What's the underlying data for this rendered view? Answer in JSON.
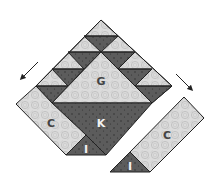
{
  "diagram": {
    "type": "quilt-block-assembly",
    "colors": {
      "light_fabric": "#d8d8d8",
      "light_swirl": "#bdbdbd",
      "dark_fabric": "#5a5a5a",
      "dark_dots": "#2e2e2e",
      "outline": "#222222",
      "label_light": "#444444",
      "label_dark": "#f2f2f2",
      "arrow": "#222222"
    },
    "labels": {
      "g": "G",
      "k": "K",
      "c_left": "C",
      "i_left": "I",
      "c_right": "C",
      "i_right": "I"
    },
    "pieces": [
      {
        "id": "G",
        "fabric": "light",
        "shape": "large triangle"
      },
      {
        "id": "K",
        "fabric": "dark",
        "shape": "large triangle"
      },
      {
        "id": "C",
        "fabric": "light",
        "shape": "strip",
        "count": 2
      },
      {
        "id": "I",
        "fabric": "dark",
        "shape": "small triangle",
        "count": 2
      }
    ],
    "arrows": [
      {
        "name": "arrow-left",
        "direction": "down-left"
      },
      {
        "name": "arrow-right",
        "direction": "down-right"
      }
    ]
  }
}
